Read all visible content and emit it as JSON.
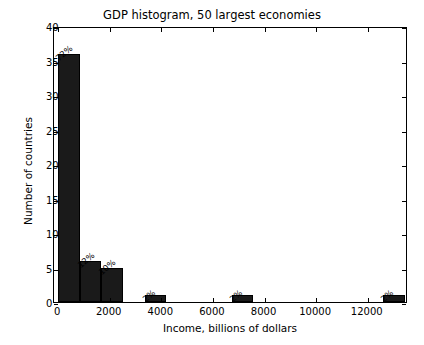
{
  "chart_data": {
    "type": "bar",
    "title": "GDP histogram, 50 largest economies",
    "xlabel": "Income, billions of dollars",
    "ylabel": "Number of countries",
    "xlim": [
      -160,
      13560
    ],
    "ylim": [
      0,
      40
    ],
    "grid": false,
    "legend": null,
    "bar_color": "#1a1a1a",
    "edge_color": "#000000",
    "bin_width": 840,
    "bin_count": 16,
    "total_countries": 50,
    "xticks": [
      0,
      2000,
      4000,
      6000,
      8000,
      10000,
      12000
    ],
    "xticklabels": [
      "0",
      "2000",
      "4000",
      "6000",
      "8000",
      "10000",
      "12000"
    ],
    "yticks": [
      0,
      5,
      10,
      15,
      20,
      25,
      30,
      35,
      40
    ],
    "yticklabels": [
      "0",
      "5",
      "10",
      "15",
      "20",
      "25",
      "30",
      "35",
      "40"
    ],
    "bars": [
      {
        "bin_start": 0,
        "bin_end": 840,
        "value": 36,
        "label": "72%"
      },
      {
        "bin_start": 840,
        "bin_end": 1680,
        "value": 6,
        "label": "12%"
      },
      {
        "bin_start": 1680,
        "bin_end": 2520,
        "value": 5,
        "label": "10%"
      },
      {
        "bin_start": 2520,
        "bin_end": 3360,
        "value": 0,
        "label": ""
      },
      {
        "bin_start": 3360,
        "bin_end": 4200,
        "value": 1,
        "label": "2%"
      },
      {
        "bin_start": 4200,
        "bin_end": 5040,
        "value": 0,
        "label": ""
      },
      {
        "bin_start": 5040,
        "bin_end": 5880,
        "value": 0,
        "label": ""
      },
      {
        "bin_start": 5880,
        "bin_end": 6720,
        "value": 0,
        "label": ""
      },
      {
        "bin_start": 6720,
        "bin_end": 7560,
        "value": 1,
        "label": "2%"
      },
      {
        "bin_start": 7560,
        "bin_end": 8400,
        "value": 0,
        "label": ""
      },
      {
        "bin_start": 8400,
        "bin_end": 9240,
        "value": 0,
        "label": ""
      },
      {
        "bin_start": 9240,
        "bin_end": 10080,
        "value": 0,
        "label": ""
      },
      {
        "bin_start": 10080,
        "bin_end": 10920,
        "value": 0,
        "label": ""
      },
      {
        "bin_start": 10920,
        "bin_end": 11760,
        "value": 0,
        "label": ""
      },
      {
        "bin_start": 11760,
        "bin_end": 12600,
        "value": 0,
        "label": ""
      },
      {
        "bin_start": 12600,
        "bin_end": 13440,
        "value": 1,
        "label": "2%"
      }
    ]
  }
}
